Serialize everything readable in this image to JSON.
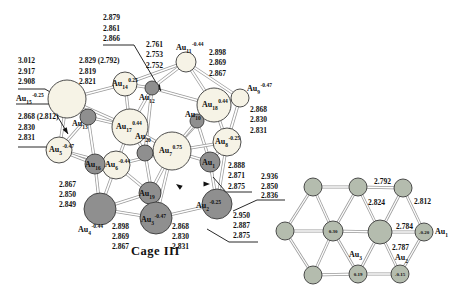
{
  "figure": {
    "caption": "Cage III"
  },
  "colors": {
    "background": "#ffffff",
    "light_atom": "#f6f3e6",
    "dark_atom": "#8f8f8f",
    "planar_atom": "#b4bcae",
    "atom_stroke": "#3a3a3a",
    "bond_outer": "#9a9a9a",
    "bond_inner": "#ffffff",
    "text": "#111111"
  },
  "cage": {
    "atoms": [
      {
        "id": "Au15",
        "sub": "15",
        "sup": "-0.25",
        "x": 67,
        "y": 99,
        "r": 19,
        "shade": "light",
        "lx": 16,
        "ly": 101
      },
      {
        "id": "Au14",
        "sub": "14",
        "sup": "0.25",
        "x": 125,
        "y": 84,
        "r": 12,
        "shade": "light",
        "lx": 112,
        "ly": 86
      },
      {
        "id": "Au11",
        "sub": "11",
        "sup": "-0.44",
        "x": 186,
        "y": 62,
        "r": 10,
        "shade": "light",
        "lx": 176,
        "ly": 50
      },
      {
        "id": "Au9",
        "sub": "9",
        "sup": "-0.47",
        "x": 240,
        "y": 98,
        "r": 9,
        "shade": "light",
        "lx": 247,
        "ly": 91
      },
      {
        "id": "Au18",
        "sub": "18",
        "sup": "0.44",
        "x": 214,
        "y": 105,
        "r": 17,
        "shade": "light",
        "lx": 202,
        "ly": 107
      },
      {
        "id": "Au17",
        "sub": "17",
        "sup": "0.44",
        "x": 130,
        "y": 127,
        "r": 18,
        "shade": "light",
        "lx": 116,
        "ly": 129
      },
      {
        "id": "Au5",
        "sub": "5",
        "sup": "-0.47",
        "x": 59,
        "y": 150,
        "r": 13,
        "shade": "light",
        "lx": 49,
        "ly": 152
      },
      {
        "id": "Au6",
        "sub": "6",
        "sup": "-0.44",
        "x": 116,
        "y": 165,
        "r": 14,
        "shade": "light",
        "lx": 105,
        "ly": 167
      },
      {
        "id": "Au7",
        "sub": "7",
        "sup": "0.75",
        "x": 172,
        "y": 151,
        "r": 19,
        "shade": "light",
        "lx": 159,
        "ly": 153
      },
      {
        "id": "Au8",
        "sub": "8",
        "sup": "-0.25",
        "x": 227,
        "y": 142,
        "r": 14,
        "shade": "light",
        "lx": 215,
        "ly": 144
      },
      {
        "id": "Au12",
        "sub": "12",
        "sup": "",
        "x": 152,
        "y": 88,
        "r": 7,
        "shade": "dark",
        "lx": 139,
        "ly": 100
      },
      {
        "id": "Au13",
        "sub": "13",
        "sup": "",
        "x": 88,
        "y": 117,
        "r": 8,
        "shade": "dark",
        "lx": 72,
        "ly": 126
      },
      {
        "id": "Au10",
        "sub": "10",
        "sup": "",
        "x": 197,
        "y": 121,
        "r": 7,
        "shade": "dark",
        "lx": 185,
        "ly": 117
      },
      {
        "id": "Au16",
        "sub": "16",
        "sup": "",
        "x": 95,
        "y": 164,
        "r": 10,
        "shade": "dark",
        "lx": 85,
        "ly": 167
      },
      {
        "id": "Au20",
        "sub": "20",
        "sup": "",
        "x": 145,
        "y": 153,
        "r": 8,
        "shade": "dark",
        "lx": 135,
        "ly": 139
      },
      {
        "id": "Au1",
        "sub": "1",
        "sup": "",
        "x": 210,
        "y": 162,
        "r": 10,
        "shade": "dark",
        "lx": 202,
        "ly": 165
      },
      {
        "id": "Au19",
        "sub": "19",
        "sup": "",
        "x": 150,
        "y": 193,
        "r": 11,
        "shade": "dark",
        "lx": 139,
        "ly": 196
      },
      {
        "id": "Au4",
        "sub": "4",
        "sup": "-0.44",
        "x": 100,
        "y": 209,
        "r": 16,
        "shade": "dark",
        "lx": 78,
        "ly": 232
      },
      {
        "id": "Au3",
        "sub": "3",
        "sup": "-0.47",
        "x": 156,
        "y": 218,
        "r": 16,
        "shade": "dark",
        "lx": 141,
        "ly": 222
      },
      {
        "id": "Au2",
        "sub": "2",
        "sup": "-0.25",
        "x": 217,
        "y": 204,
        "r": 15,
        "shade": "dark",
        "lx": 196,
        "ly": 208
      }
    ],
    "bonds": [
      [
        "Au15",
        "Au14"
      ],
      [
        "Au15",
        "Au13"
      ],
      [
        "Au15",
        "Au5"
      ],
      [
        "Au15",
        "Au17"
      ],
      [
        "Au14",
        "Au11"
      ],
      [
        "Au14",
        "Au12"
      ],
      [
        "Au14",
        "Au17"
      ],
      [
        "Au11",
        "Au12"
      ],
      [
        "Au11",
        "Au18"
      ],
      [
        "Au11",
        "Au9"
      ],
      [
        "Au12",
        "Au17"
      ],
      [
        "Au12",
        "Au18"
      ],
      [
        "Au12",
        "Au20"
      ],
      [
        "Au9",
        "Au18"
      ],
      [
        "Au9",
        "Au8"
      ],
      [
        "Au18",
        "Au10"
      ],
      [
        "Au18",
        "Au7"
      ],
      [
        "Au18",
        "Au8"
      ],
      [
        "Au10",
        "Au7"
      ],
      [
        "Au10",
        "Au1"
      ],
      [
        "Au17",
        "Au13"
      ],
      [
        "Au17",
        "Au6"
      ],
      [
        "Au17",
        "Au7"
      ],
      [
        "Au17",
        "Au20"
      ],
      [
        "Au13",
        "Au5"
      ],
      [
        "Au13",
        "Au16"
      ],
      [
        "Au5",
        "Au6"
      ],
      [
        "Au5",
        "Au16"
      ],
      [
        "Au6",
        "Au16"
      ],
      [
        "Au6",
        "Au7"
      ],
      [
        "Au6",
        "Au4"
      ],
      [
        "Au6",
        "Au19"
      ],
      [
        "Au7",
        "Au20"
      ],
      [
        "Au7",
        "Au8"
      ],
      [
        "Au7",
        "Au1"
      ],
      [
        "Au7",
        "Au19"
      ],
      [
        "Au7",
        "Au3"
      ],
      [
        "Au8",
        "Au1"
      ],
      [
        "Au8",
        "Au2"
      ],
      [
        "Au1",
        "Au2"
      ],
      [
        "Au16",
        "Au4"
      ],
      [
        "Au20",
        "Au3"
      ],
      [
        "Au4",
        "Au19"
      ],
      [
        "Au4",
        "Au3"
      ],
      [
        "Au19",
        "Au3"
      ],
      [
        "Au3",
        "Au2"
      ]
    ],
    "measurements": [
      {
        "id": "m-top",
        "x": 103,
        "y": 20,
        "lh": 10.5,
        "lines": [
          "2.879",
          "2.861",
          "2.866"
        ]
      },
      {
        "id": "m-11-left",
        "x": 146,
        "y": 47,
        "lh": 10.4,
        "lines": [
          "2.761",
          "2.753",
          "2.752"
        ]
      },
      {
        "id": "m-11-right",
        "x": 209,
        "y": 55,
        "lh": 10.4,
        "lines": [
          "2.898",
          "2.869",
          "2.867"
        ]
      },
      {
        "id": "m-15-top",
        "x": 18,
        "y": 63,
        "lh": 10.7,
        "lines": [
          "3.012",
          "2.917",
          "2.908"
        ]
      },
      {
        "id": "m-14",
        "x": 79,
        "y": 63,
        "lh": 10.7,
        "lines": [
          "2.829 (2.792)",
          "2.819",
          "2.821"
        ]
      },
      {
        "id": "m-15-bottom",
        "x": 18,
        "y": 119,
        "lh": 10.7,
        "lines": [
          "2.868 (2.812)",
          "2.830",
          "2.831"
        ]
      },
      {
        "id": "m-9",
        "x": 250,
        "y": 112,
        "lh": 10.4,
        "lines": [
          "2.868",
          "2.830",
          "2.831"
        ]
      },
      {
        "id": "m-8",
        "x": 228,
        "y": 168,
        "lh": 10.4,
        "lines": [
          "2.888",
          "2.871",
          "2.875"
        ]
      },
      {
        "id": "m-8-right",
        "x": 261,
        "y": 179,
        "lh": 9.6,
        "lines": [
          "2.936",
          "2.850",
          "2.836"
        ]
      },
      {
        "id": "m-2",
        "x": 233,
        "y": 218,
        "lh": 10.2,
        "lines": [
          "2.950",
          "2.887",
          "2.875"
        ]
      },
      {
        "id": "m-4-left",
        "x": 59,
        "y": 187,
        "lh": 10.2,
        "lines": [
          "2.867",
          "2.850",
          "2.849"
        ]
      },
      {
        "id": "m-4",
        "x": 112,
        "y": 229,
        "lh": 10.2,
        "lines": [
          "2.898",
          "2.869",
          "2.867"
        ]
      },
      {
        "id": "m-3",
        "x": 172,
        "y": 229,
        "lh": 10.2,
        "lines": [
          "2.868",
          "2.830",
          "2.831"
        ]
      }
    ],
    "leaders": [
      {
        "points": [
          [
            103,
            45
          ],
          [
            134,
            45
          ],
          [
            161,
            91
          ]
        ],
        "arrow": true
      },
      {
        "points": [
          [
            18,
            89
          ],
          [
            45,
            89
          ],
          [
            57,
            96
          ]
        ],
        "arrow": false
      },
      {
        "points": [
          [
            16,
            104
          ],
          [
            50,
            104
          ],
          [
            68,
            134
          ]
        ],
        "arrow": true
      },
      {
        "points": [
          [
            18,
            147
          ],
          [
            62,
            147
          ]
        ],
        "arrow": false
      },
      {
        "points": [
          [
            252,
            192
          ],
          [
            226,
            192
          ],
          [
            213,
            177
          ]
        ],
        "arrow": false
      },
      {
        "points": [
          [
            285,
            200
          ],
          [
            257,
            200
          ],
          [
            233,
            211
          ]
        ],
        "arrow": false
      },
      {
        "points": [
          [
            258,
            242
          ],
          [
            229,
            242
          ],
          [
            207,
            229
          ]
        ],
        "arrow": false
      }
    ],
    "arrows": [
      {
        "x": 176,
        "y": 184,
        "angle": 215
      },
      {
        "x": 210,
        "y": 184,
        "angle": 0
      }
    ]
  },
  "planar": {
    "atoms": [
      {
        "x": 313,
        "y": 187,
        "r": 9
      },
      {
        "x": 358,
        "y": 187,
        "r": 9
      },
      {
        "x": 403,
        "y": 188,
        "r": 9
      },
      {
        "x": 285,
        "y": 231,
        "r": 9
      },
      {
        "x": 333,
        "y": 231,
        "r": 10,
        "charge": "0.30"
      },
      {
        "x": 380,
        "y": 232,
        "r": 12
      },
      {
        "x": 424,
        "y": 232,
        "r": 9,
        "charge": "-0.20"
      },
      {
        "x": 313,
        "y": 275,
        "r": 9
      },
      {
        "x": 358,
        "y": 274,
        "r": 9,
        "charge": "0.19"
      },
      {
        "x": 400,
        "y": 274,
        "r": 9,
        "charge": "-0.15"
      }
    ],
    "bonds": [
      [
        0,
        1
      ],
      [
        1,
        2
      ],
      [
        3,
        4
      ],
      [
        4,
        5
      ],
      [
        5,
        6
      ],
      [
        7,
        8
      ],
      [
        8,
        9
      ],
      [
        0,
        3
      ],
      [
        0,
        4
      ],
      [
        1,
        4
      ],
      [
        1,
        5
      ],
      [
        2,
        5
      ],
      [
        2,
        6
      ],
      [
        3,
        7
      ],
      [
        4,
        7
      ],
      [
        4,
        8
      ],
      [
        5,
        8
      ],
      [
        5,
        9
      ],
      [
        6,
        9
      ]
    ],
    "bond_labels": [
      {
        "text": "2.792",
        "x": 374,
        "y": 184
      },
      {
        "text": "2.824",
        "x": 368,
        "y": 205
      },
      {
        "text": "2.812",
        "x": 414,
        "y": 204
      },
      {
        "text": "2.784",
        "x": 396,
        "y": 229
      },
      {
        "text": "2.787",
        "x": 392,
        "y": 250
      }
    ],
    "atom_labels": [
      {
        "sub": "1",
        "x": 435,
        "y": 234
      },
      {
        "sub": "2",
        "x": 395,
        "y": 260
      },
      {
        "sub": "3",
        "x": 349,
        "y": 257
      }
    ]
  }
}
